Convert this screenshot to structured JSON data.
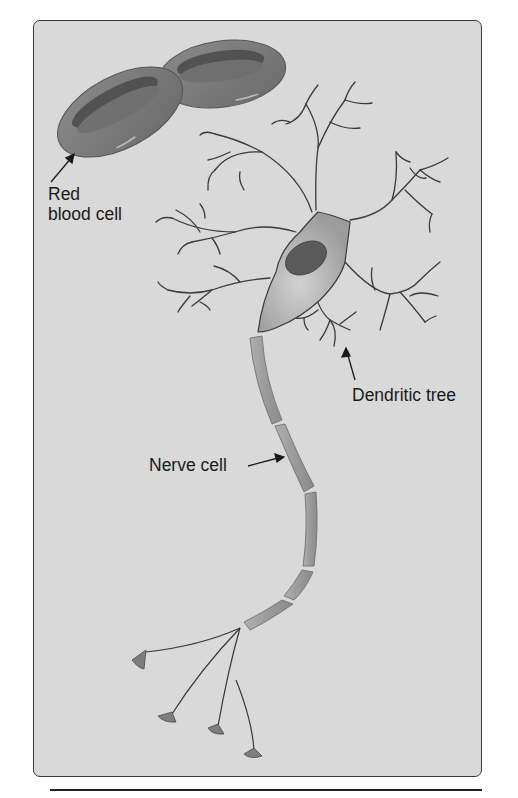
{
  "figure": {
    "type": "illustration",
    "colors": {
      "background": "#ffffff",
      "panel": "#d9d9d9",
      "panel_border": "#3a3a3a",
      "cell_fill": "#7a7a7a",
      "cell_dark": "#4a4a4a",
      "neuron_fill": "#a9a9a9",
      "nucleus": "#5a5a5a",
      "line": "#3a3a3a",
      "text": "#1a1a1a"
    }
  },
  "labels": {
    "red_blood_cell_line1": "Red",
    "red_blood_cell_line2": "blood cell",
    "dendritic_tree": "Dendritic tree",
    "nerve_cell": "Nerve cell"
  }
}
